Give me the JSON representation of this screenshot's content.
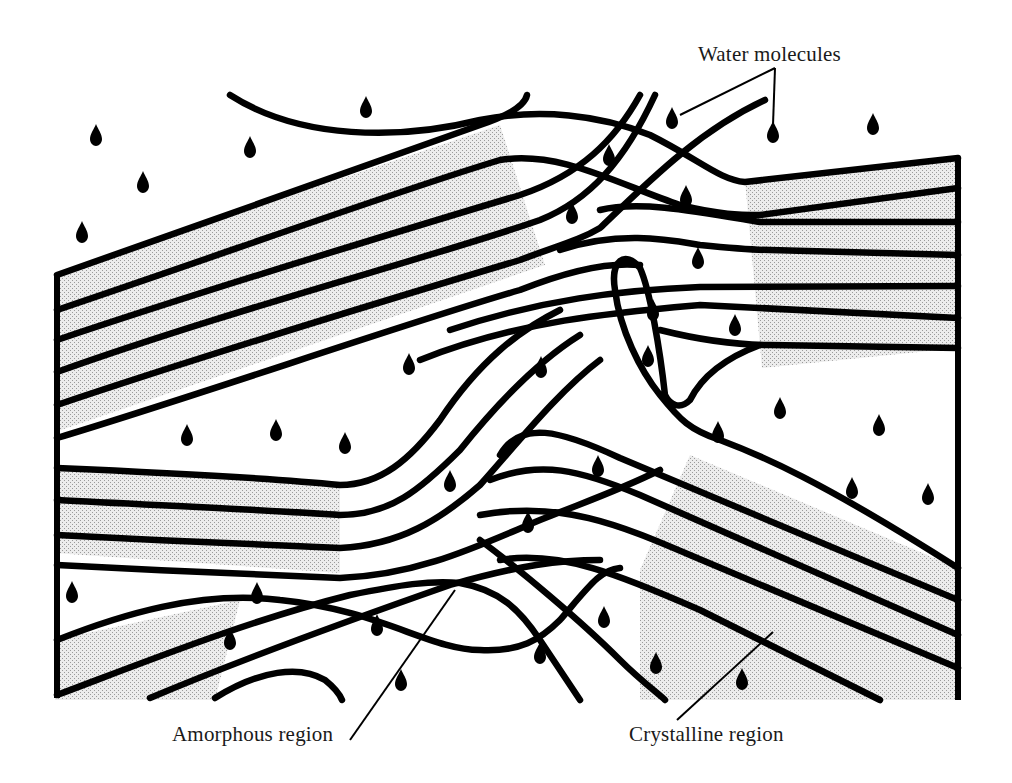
{
  "diagram": {
    "title": "",
    "labels": {
      "water": "Water molecules",
      "amorphous": "Amorphous region",
      "crystalline": "Crystalline region"
    },
    "colors": {
      "line": "#000000",
      "crystalline_fill": "#d6d6d6",
      "background": "#ffffff"
    },
    "water_molecules": [
      [
        96,
        135
      ],
      [
        250,
        147
      ],
      [
        366,
        107
      ],
      [
        143,
        182
      ],
      [
        82,
        232
      ],
      [
        672,
        118
      ],
      [
        773,
        132
      ],
      [
        873,
        124
      ],
      [
        609,
        155
      ],
      [
        572,
        213
      ],
      [
        686,
        196
      ],
      [
        698,
        258
      ],
      [
        653,
        310
      ],
      [
        735,
        325
      ],
      [
        648,
        356
      ],
      [
        541,
        367
      ],
      [
        409,
        364
      ],
      [
        187,
        435
      ],
      [
        276,
        430
      ],
      [
        345,
        443
      ],
      [
        718,
        432
      ],
      [
        780,
        408
      ],
      [
        879,
        425
      ],
      [
        450,
        481
      ],
      [
        598,
        466
      ],
      [
        528,
        522
      ],
      [
        852,
        488
      ],
      [
        928,
        494
      ],
      [
        72,
        592
      ],
      [
        257,
        593
      ],
      [
        230,
        639
      ],
      [
        377,
        625
      ],
      [
        401,
        680
      ],
      [
        540,
        653
      ],
      [
        604,
        617
      ],
      [
        656,
        663
      ],
      [
        742,
        679
      ]
    ],
    "regions": [
      {
        "name": "crystalline-upper-left",
        "type": "crystalline"
      },
      {
        "name": "crystalline-left-middle",
        "type": "crystalline"
      },
      {
        "name": "crystalline-right",
        "type": "crystalline"
      },
      {
        "name": "crystalline-lower-right",
        "type": "crystalline"
      },
      {
        "name": "crystalline-lower-left",
        "type": "crystalline"
      },
      {
        "name": "amorphous-center",
        "type": "amorphous"
      }
    ]
  }
}
